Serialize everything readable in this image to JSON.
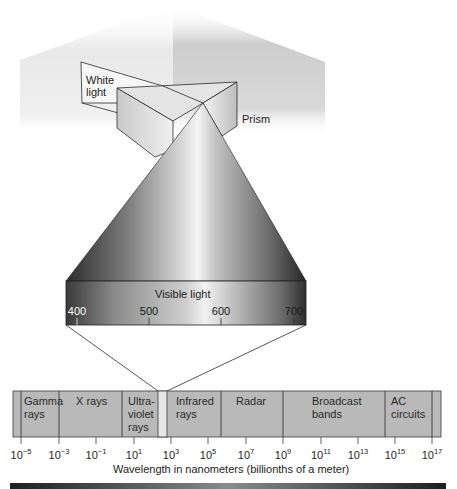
{
  "diagram": {
    "labels": {
      "white_light": "White\nlight",
      "prism": "Prism",
      "visible_light": "Visible light",
      "axis_title": "Wavelength in nanometers (billionths of a meter)"
    },
    "visible_ticks": [
      {
        "label": "400",
        "x": 77
      },
      {
        "label": "500",
        "x": 149
      },
      {
        "label": "600",
        "x": 221
      },
      {
        "label": "700",
        "x": 294
      }
    ],
    "bands": [
      {
        "name": "gamma",
        "label": "Gamma\nrays",
        "x0": 21,
        "x1": 59
      },
      {
        "name": "x-rays",
        "label": "X rays",
        "x0": 59,
        "x1": 122
      },
      {
        "name": "ultraviolet",
        "label": "Ultra-\nviolet\nrays",
        "x0": 122,
        "x1": 158
      },
      {
        "name": "visible",
        "label": "",
        "x0": 158,
        "x1": 167
      },
      {
        "name": "infrared",
        "label": "Infrared\nrays",
        "x0": 167,
        "x1": 221
      },
      {
        "name": "radar",
        "label": "Radar",
        "x0": 221,
        "x1": 283
      },
      {
        "name": "broadcast",
        "label": "Broadcast\nbands",
        "x0": 283,
        "x1": 385
      },
      {
        "name": "ac-circuits",
        "label": "AC\ncircuits",
        "x0": 385,
        "x1": 432
      }
    ],
    "wavelength_ticks": [
      {
        "base": "10",
        "exp": "−5",
        "x": 21
      },
      {
        "base": "10",
        "exp": "−3",
        "x": 59
      },
      {
        "base": "10",
        "exp": "−1",
        "x": 96
      },
      {
        "base": "10",
        "exp": "1",
        "x": 134
      },
      {
        "base": "10",
        "exp": "3",
        "x": 171
      },
      {
        "base": "10",
        "exp": "5",
        "x": 208
      },
      {
        "base": "10",
        "exp": "7",
        "x": 246
      },
      {
        "base": "10",
        "exp": "9",
        "x": 283
      },
      {
        "base": "10",
        "exp": "11",
        "x": 321
      },
      {
        "base": "10",
        "exp": "13",
        "x": 358
      },
      {
        "base": "10",
        "exp": "15",
        "x": 395
      },
      {
        "base": "10",
        "exp": "17",
        "x": 432
      }
    ],
    "colors": {
      "band_fill": "#b9b9b9",
      "line": "#2b2b2b",
      "wall_left": "#ececec",
      "wall_right": "#cfcfcf",
      "cone_dark": "#2e2e2e",
      "cone_light": "#f4f4f4"
    }
  }
}
